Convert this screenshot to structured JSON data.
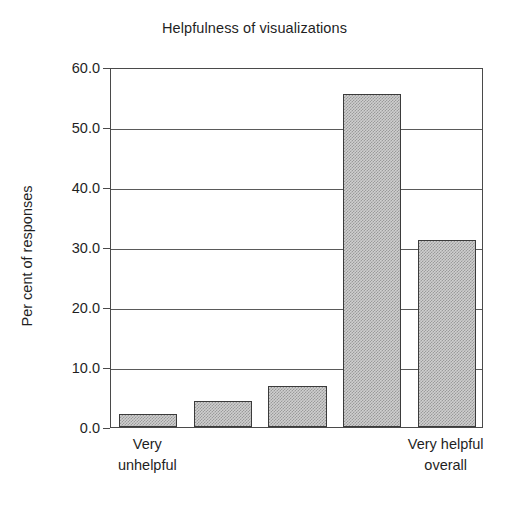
{
  "chart_data": {
    "type": "bar",
    "title": "Helpfulness of visualizations",
    "xlabel": "",
    "ylabel": "Per cent of responses",
    "categories": [
      "Very unhelpful",
      "2",
      "3",
      "4",
      "Very helpful overall"
    ],
    "category_labels_shown": [
      {
        "index": 0,
        "line1": "Very",
        "line2": "unhelpful"
      },
      {
        "index": 4,
        "line1": "Very helpful",
        "line2": "overall"
      }
    ],
    "values": [
      2.2,
      4.4,
      6.9,
      55.5,
      31.2
    ],
    "ylim": [
      0.0,
      60.0
    ],
    "ytick_values": [
      0.0,
      10.0,
      20.0,
      30.0,
      40.0,
      50.0,
      60.0
    ],
    "ytick_labels": [
      "0.0",
      "10.0",
      "20.0",
      "30.0",
      "40.0",
      "50.0",
      "60.0"
    ],
    "grid": true,
    "grid_axis": "y",
    "legend": false,
    "bar_fill_color": "#cfcfcf",
    "bar_edge_color": "#3b3b3b",
    "axis_color": "#4a4a4a",
    "text_color": "#1f1f1f",
    "background_color": "#ffffff"
  }
}
